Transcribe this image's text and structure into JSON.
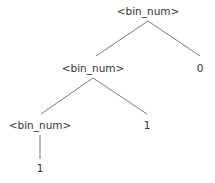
{
  "diagram": {
    "type": "parse-tree",
    "nodes": [
      {
        "id": "n0",
        "label": "<bin_num>",
        "x": 148,
        "y": 5
      },
      {
        "id": "n1",
        "label": "<bin_num>",
        "x": 93,
        "y": 62
      },
      {
        "id": "n2",
        "label": "0",
        "x": 200,
        "y": 62
      },
      {
        "id": "n3",
        "label": "<bin_num>",
        "x": 40,
        "y": 119
      },
      {
        "id": "n4",
        "label": "1",
        "x": 147,
        "y": 119
      },
      {
        "id": "n5",
        "label": "1",
        "x": 40,
        "y": 162
      }
    ],
    "edges": [
      {
        "from": "n0",
        "to": "n1",
        "x1": 148,
        "y1": 21,
        "x2": 96,
        "y2": 56
      },
      {
        "from": "n0",
        "to": "n2",
        "x1": 148,
        "y1": 21,
        "x2": 200,
        "y2": 56
      },
      {
        "from": "n1",
        "to": "n3",
        "x1": 93,
        "y1": 78,
        "x2": 41,
        "y2": 114
      },
      {
        "from": "n1",
        "to": "n4",
        "x1": 93,
        "y1": 78,
        "x2": 147,
        "y2": 114
      },
      {
        "from": "n3",
        "to": "n5",
        "x1": 40,
        "y1": 135,
        "x2": 40,
        "y2": 159
      }
    ]
  }
}
